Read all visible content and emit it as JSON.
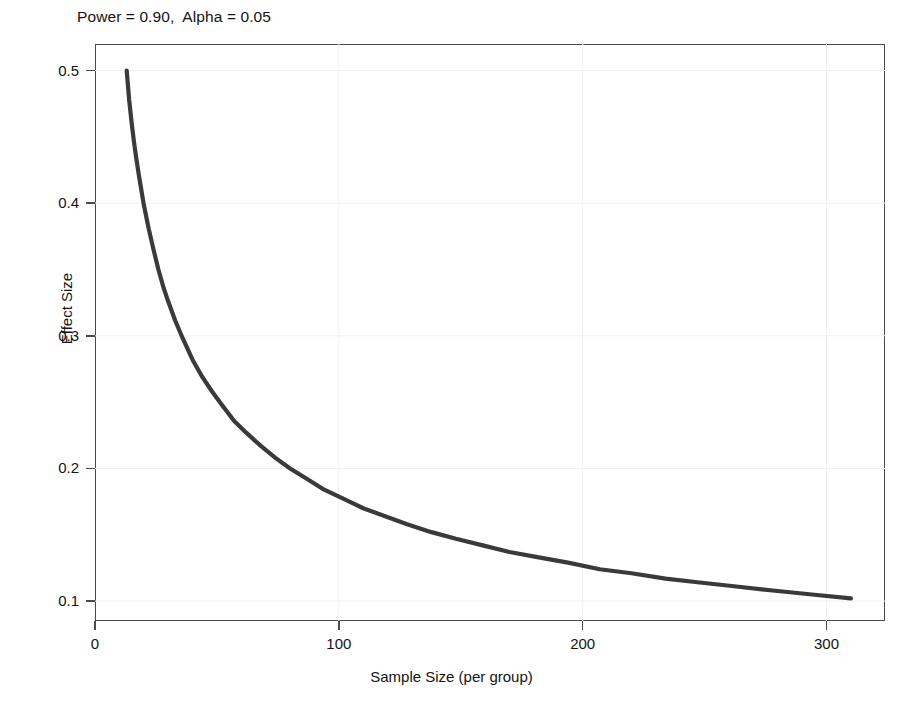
{
  "chart_data": {
    "type": "line",
    "title": "Power = 0.90,  Alpha = 0.05",
    "xlabel": "Sample Size (per group)",
    "ylabel": "Effect Size",
    "xlim": [
      0,
      324
    ],
    "ylim": [
      0.085,
      0.52
    ],
    "xticks": [
      0,
      100,
      200,
      300
    ],
    "xtick_labels": [
      "0",
      "100",
      "200",
      "300"
    ],
    "yticks": [
      0.1,
      0.2,
      0.3,
      0.4,
      0.5
    ],
    "ytick_labels": [
      "0.1",
      "0.2",
      "0.3",
      "0.4",
      "0.5"
    ],
    "grid": true,
    "legend": "none",
    "series": [
      {
        "name": "Detectable effect size at 90% power",
        "color": "#3a3a3a",
        "x": [
          13,
          14,
          15,
          16,
          17,
          18,
          20,
          22,
          24,
          26,
          28,
          30,
          33,
          36,
          40,
          44,
          48,
          52,
          57,
          62,
          68,
          74,
          80,
          87,
          94,
          102,
          110,
          119,
          128,
          138,
          148,
          159,
          170,
          182,
          194,
          207,
          220,
          234,
          248,
          263,
          278,
          294,
          310
        ],
        "y": [
          0.5,
          0.478,
          0.461,
          0.446,
          0.433,
          0.421,
          0.399,
          0.381,
          0.365,
          0.35,
          0.337,
          0.326,
          0.311,
          0.298,
          0.282,
          0.269,
          0.258,
          0.248,
          0.236,
          0.227,
          0.217,
          0.208,
          0.2,
          0.192,
          0.184,
          0.177,
          0.17,
          0.164,
          0.158,
          0.152,
          0.147,
          0.142,
          0.137,
          0.133,
          0.129,
          0.124,
          0.121,
          0.117,
          0.114,
          0.111,
          0.108,
          0.105,
          0.102
        ]
      }
    ],
    "annotations": {
      "power": "0.90",
      "alpha": "0.05"
    }
  },
  "figure": {
    "title": "Power = 0.90,  Alpha = 0.05",
    "x_axis_title": "Sample Size (per group)",
    "y_axis_title": "Effect Size"
  }
}
